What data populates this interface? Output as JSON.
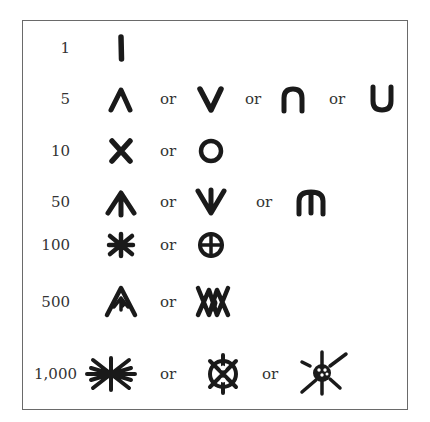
{
  "figure": {
    "title_partial": "",
    "rows": [
      {
        "value": "1",
        "symbols": [
          "vertical-stroke"
        ],
        "separators": []
      },
      {
        "value": "5",
        "symbols": [
          "caret-up",
          "v-shape",
          "arch",
          "u-shape"
        ],
        "separators": [
          "or",
          "or",
          "or"
        ]
      },
      {
        "value": "10",
        "symbols": [
          "x-cross",
          "circle"
        ],
        "separators": [
          "or"
        ]
      },
      {
        "value": "50",
        "symbols": [
          "arrow-up-with-stem",
          "v-with-stem",
          "m-arch"
        ],
        "separators": [
          "or",
          "or"
        ]
      },
      {
        "value": "100",
        "symbols": [
          "asterisk",
          "circle-cross"
        ],
        "separators": [
          "or"
        ]
      },
      {
        "value": "500",
        "symbols": [
          "caret-with-d",
          "double-x-with-d"
        ],
        "separators": [
          "or"
        ]
      },
      {
        "value": "1,000",
        "symbols": [
          "eight-ray-star",
          "wheel-with-spokes",
          "dotted-sun"
        ],
        "separators": [
          "or",
          "or"
        ]
      }
    ]
  }
}
